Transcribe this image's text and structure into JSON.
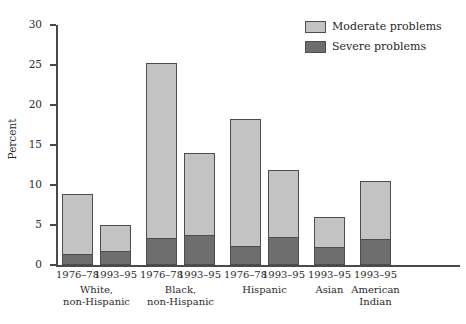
{
  "chart_data": {
    "type": "bar",
    "subtype": "stacked-bar",
    "title": "",
    "xlabel": "",
    "ylabel": "Percent",
    "ylim": [
      0,
      30
    ],
    "yticks": [
      0,
      5,
      10,
      15,
      20,
      25,
      30
    ],
    "grid": false,
    "legend_position": "top-right",
    "categories": [
      "1976–78",
      "1993–95",
      "1976–78",
      "1993–95",
      "1976–78",
      "1993–95",
      "1993–95",
      "1993–95"
    ],
    "groups": [
      {
        "label": "White,\nnon-Hispanic",
        "line1": "White,",
        "line2": "non-Hispanic",
        "bars": 2
      },
      {
        "label": "Black,\nnon-Hispanic",
        "line1": "Black,",
        "line2": "non-Hispanic",
        "bars": 2
      },
      {
        "label": "Hispanic",
        "line1": "Hispanic",
        "line2": "",
        "bars": 2
      },
      {
        "label": "Asian",
        "line1": "Asian",
        "line2": "",
        "bars": 1
      },
      {
        "label": "American\nIndian",
        "line1": "American",
        "line2": "Indian",
        "bars": 1
      }
    ],
    "series": [
      {
        "name": "Severe problems",
        "color": "#6e6e6e",
        "values": [
          1.4,
          1.8,
          3.4,
          3.8,
          2.4,
          3.5,
          2.2,
          3.3
        ]
      },
      {
        "name": "Moderate problems",
        "color": "#c3c3c3",
        "values": [
          7.5,
          3.2,
          21.9,
          10.2,
          15.8,
          8.4,
          3.8,
          7.2
        ]
      }
    ],
    "totals": [
      8.9,
      5.0,
      25.3,
      14.0,
      18.2,
      11.9,
      6.0,
      10.5
    ],
    "bars": [
      {
        "group": "White, non-Hispanic",
        "period": "1976–78",
        "severe": 1.4,
        "moderate": 7.5,
        "total": 8.9
      },
      {
        "group": "White, non-Hispanic",
        "period": "1993–95",
        "severe": 1.8,
        "moderate": 3.2,
        "total": 5.0
      },
      {
        "group": "Black, non-Hispanic",
        "period": "1976–78",
        "severe": 3.4,
        "moderate": 21.9,
        "total": 25.3
      },
      {
        "group": "Black, non-Hispanic",
        "period": "1993–95",
        "severe": 3.8,
        "moderate": 10.2,
        "total": 14.0
      },
      {
        "group": "Hispanic",
        "period": "1976–78",
        "severe": 2.4,
        "moderate": 15.8,
        "total": 18.2
      },
      {
        "group": "Hispanic",
        "period": "1993–95",
        "severe": 3.5,
        "moderate": 8.4,
        "total": 11.9
      },
      {
        "group": "Asian",
        "period": "1993–95",
        "severe": 2.2,
        "moderate": 3.8,
        "total": 6.0
      },
      {
        "group": "American Indian",
        "period": "1993–95",
        "severe": 3.3,
        "moderate": 7.2,
        "total": 10.5
      }
    ]
  },
  "axis": {
    "y_title": "Percent",
    "y_tick_labels": [
      "30",
      "25",
      "20",
      "15",
      "10",
      "5",
      "0"
    ]
  },
  "legend": {
    "items": [
      {
        "label": "Moderate problems",
        "color": "#c3c3c3"
      },
      {
        "label": "Severe problems",
        "color": "#6e6e6e"
      }
    ]
  }
}
